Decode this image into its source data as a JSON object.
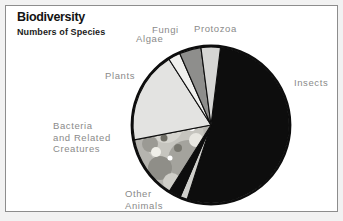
{
  "header": {
    "title": "Biodiversity",
    "subtitle": "Numbers of Species"
  },
  "colors": {
    "insects": "#0d0d0d",
    "plants": "#e3e3e1",
    "protozoa": "#d6d6d4",
    "fungi": "#8e8e8c",
    "algae": "#f0f0ee",
    "bacteria": "#b3b2ad",
    "viruses": "#cfcfcb",
    "other_animals": "#0d0d0d",
    "label_text": "#8a8a8a",
    "title_text": "#131313",
    "outline": "#0d0d0d",
    "frame_border": "#8d8d8d",
    "page_background": "#f2f2f2",
    "panel_background": "#ffffff"
  },
  "labels": {
    "fungi": "Fungi",
    "protozoa": "Protozoa",
    "algae": "Algae",
    "plants": "Plants",
    "bacteria": "Bacteria\nand Related\nCreatures",
    "insects": "Insects",
    "other_animals": "Other\nAnimals",
    "viruses": "Viruses"
  },
  "chart_data": {
    "type": "pie",
    "title": "Biodiversity",
    "subtitle": "Numbers of Species",
    "units": "share of total described species",
    "legend": "none (direct labels around pie)",
    "start_angle_deg": -83,
    "direction": "clockwise",
    "categories": [
      "Insects",
      "Plants",
      "Bacteria and Related Creatures",
      "Fungi",
      "Protozoa",
      "Algae",
      "Other Animals",
      "Viruses"
    ],
    "values": [
      53.0,
      19.0,
      13.0,
      4.5,
      4.0,
      2.5,
      2.5,
      1.5
    ],
    "slices": [
      {
        "label": "Insects",
        "value": 53.0,
        "color": "#0d0d0d"
      },
      {
        "label": "Viruses",
        "value": 1.5,
        "color": "#cfcfcb"
      },
      {
        "label": "Other Animals",
        "value": 2.5,
        "color": "#0d0d0d"
      },
      {
        "label": "Bacteria and Related Creatures",
        "value": 13.0,
        "color": "#b3b2ad"
      },
      {
        "label": "Plants",
        "value": 19.0,
        "color": "#e3e3e1"
      },
      {
        "label": "Algae",
        "value": 2.5,
        "color": "#f0f0ee"
      },
      {
        "label": "Fungi",
        "value": 4.5,
        "color": "#8e8e8c"
      },
      {
        "label": "Protozoa",
        "value": 4.0,
        "color": "#d6d6d4"
      }
    ]
  }
}
